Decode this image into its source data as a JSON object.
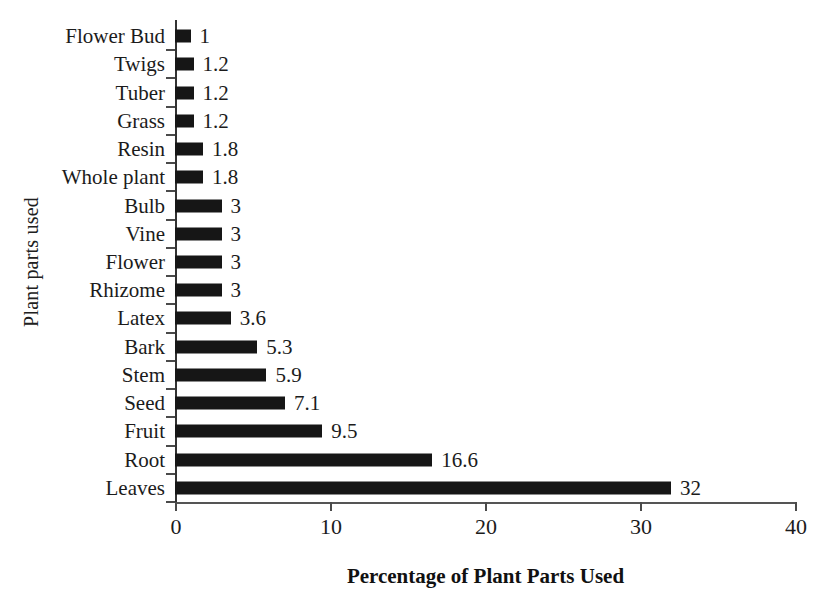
{
  "chart_data": {
    "type": "bar",
    "orientation": "horizontal",
    "title": "",
    "xlabel": "Percentage of Plant Parts Used",
    "ylabel": "Plant parts used",
    "xlim": [
      0,
      40
    ],
    "xticks": [
      0,
      10,
      20,
      30,
      40
    ],
    "xtick_labels": [
      "0",
      "10",
      "20",
      "30",
      "40"
    ],
    "grid": false,
    "legend": null,
    "bar_color": "#161616",
    "categories": [
      "Flower Bud",
      "Twigs",
      "Tuber",
      "Grass",
      "Resin",
      "Whole plant",
      "Bulb",
      "Vine",
      "Flower",
      "Rhizome",
      "Latex",
      "Bark",
      "Stem",
      "Seed",
      "Fruit",
      "Root",
      "Leaves"
    ],
    "values": [
      1,
      1.2,
      1.2,
      1.2,
      1.8,
      1.8,
      3,
      3,
      3,
      3,
      3.6,
      5.3,
      5.9,
      7.1,
      9.5,
      16.6,
      32
    ],
    "data_labels": [
      "1",
      "1.2",
      "1.2",
      "1.2",
      "1.8",
      "1.8",
      "3",
      "3",
      "3",
      "3",
      "3.6",
      "5.3",
      "5.9",
      "7.1",
      "9.5",
      "16.6",
      "32"
    ]
  }
}
